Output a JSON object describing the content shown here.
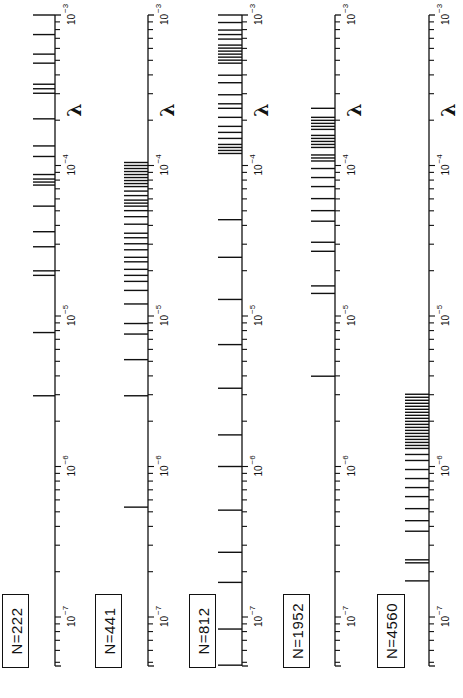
{
  "chart_data": {
    "type": "scatter",
    "title": "",
    "orientation": "rotated 90° (axes vertical, log scale increasing upward)",
    "xlabel": "λ",
    "ylabel": "",
    "axis_scale": "log",
    "xlim": [
      1e-07,
      0.001
    ],
    "tick_labels": [
      "10^-7",
      "10^-6",
      "10^-5",
      "10^-4",
      "10^-3"
    ],
    "grid": false,
    "legend": "none; each axis labeled by a boxed N value",
    "series": [
      {
        "name": "N=222",
        "label": "N=222",
        "log10_values": [
          -3.0,
          -3.13,
          -3.26,
          -3.32,
          -3.46,
          -3.49,
          -3.52,
          -3.69,
          -3.87,
          -3.94,
          -4.06,
          -4.09,
          -4.11,
          -4.13,
          -4.27,
          -4.44,
          -4.54,
          -4.7,
          -4.73,
          -5.11,
          -5.53
        ]
      },
      {
        "name": "N=441",
        "label": "N=441",
        "log10_values": [
          -3.98,
          -4.0,
          -4.02,
          -4.04,
          -4.06,
          -4.08,
          -4.1,
          -4.12,
          -4.14,
          -4.17,
          -4.2,
          -4.23,
          -4.25,
          -4.27,
          -4.3,
          -4.34,
          -4.39,
          -4.45,
          -4.48,
          -4.52,
          -4.56,
          -4.61,
          -4.64,
          -4.69,
          -4.73,
          -4.77,
          -4.83,
          -4.92,
          -5.05,
          -5.12,
          -5.29,
          -5.53,
          -6.27
        ]
      },
      {
        "name": "N=812",
        "label": "N=812",
        "log10_values": [
          -3.0,
          -3.05,
          -3.1,
          -3.13,
          -3.16,
          -3.2,
          -3.22,
          -3.24,
          -3.26,
          -3.28,
          -3.3,
          -3.32,
          -3.4,
          -3.45,
          -3.53,
          -3.59,
          -3.62,
          -3.68,
          -3.74,
          -3.78,
          -3.82,
          -3.86,
          -3.88,
          -3.9,
          -3.92,
          -4.36,
          -4.61,
          -4.89,
          -5.19,
          -5.48,
          -5.79,
          -6.0,
          -6.29,
          -6.57,
          -6.77,
          -7.08,
          -7.32
        ]
      },
      {
        "name": "N=1952",
        "label": "N=1952",
        "log10_values": [
          -3.62,
          -3.68,
          -3.7,
          -3.72,
          -3.74,
          -3.76,
          -3.8,
          -3.82,
          -3.84,
          -3.86,
          -3.88,
          -3.93,
          -3.95,
          -3.97,
          -4.02,
          -4.08,
          -4.14,
          -4.22,
          -4.3,
          -4.37,
          -4.51,
          -4.57,
          -4.8,
          -4.85,
          -5.4
        ]
      },
      {
        "name": "N=4560",
        "label": "N=4560",
        "log10_values": [
          -5.52,
          -5.54,
          -5.56,
          -5.58,
          -5.6,
          -5.62,
          -5.64,
          -5.66,
          -5.68,
          -5.7,
          -5.72,
          -5.74,
          -5.76,
          -5.78,
          -5.8,
          -5.82,
          -5.84,
          -5.86,
          -5.88,
          -5.92,
          -5.96,
          -6.02,
          -6.08,
          -6.14,
          -6.2,
          -6.28,
          -6.36,
          -6.43,
          -6.62,
          -6.64,
          -6.76
        ]
      }
    ]
  },
  "axes": {
    "lambda_symbol": "λ",
    "ticks": [
      {
        "exp": -3,
        "base": "10",
        "sup": "−3"
      },
      {
        "exp": -4,
        "base": "10",
        "sup": "−4"
      },
      {
        "exp": -5,
        "base": "10",
        "sup": "−5"
      },
      {
        "exp": -6,
        "base": "10",
        "sup": "−6"
      },
      {
        "exp": -7,
        "base": "10",
        "sup": "−7"
      }
    ]
  },
  "labels": [
    "N=222",
    "N=441",
    "N=812",
    "N=1952",
    "N=4560"
  ],
  "colors": {
    "ink": "#111111",
    "background": "#ffffff"
  }
}
